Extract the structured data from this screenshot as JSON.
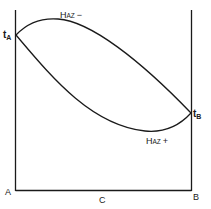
{
  "diagram": {
    "type": "phase-diagram",
    "labels": {
      "tA_main": "t",
      "tA_sub": "A",
      "tB_main": "t",
      "tB_sub": "B",
      "left_component": "A",
      "right_component": "B",
      "axis_label": "C",
      "upper_curve_main": "H",
      "upper_curve_sub": "AZ",
      "upper_curve_sign": "−",
      "lower_curve_main": "H",
      "lower_curve_sub": "AZ",
      "lower_curve_sign": "+"
    },
    "colors": {
      "line": "#1a1a1a",
      "background": "#ffffff"
    }
  }
}
